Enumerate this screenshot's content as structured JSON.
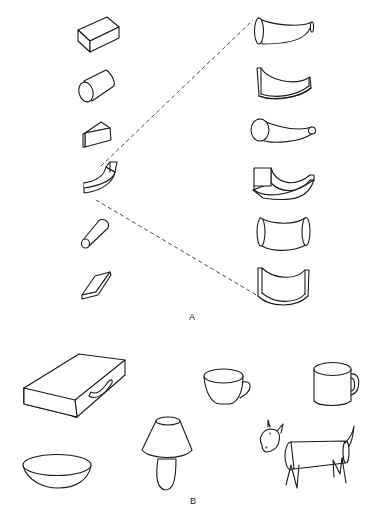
{
  "figure": {
    "colors": {
      "stroke": "#1a1a1a",
      "background": "#ffffff"
    },
    "panel_a": {
      "label": "A",
      "left_column_primitives": [
        {
          "id": "rectangular-block",
          "description": "rectangular prism"
        },
        {
          "id": "cylinder",
          "description": "cylinder"
        },
        {
          "id": "wedge",
          "description": "triangular wedge"
        },
        {
          "id": "curved-block",
          "description": "curved bent block"
        },
        {
          "id": "cone",
          "description": "truncated cone"
        },
        {
          "id": "flat-slab",
          "description": "flat parallelogram slab"
        }
      ],
      "right_column_variants": [
        {
          "id": "curved-horn-elliptic-end",
          "description": "curved tapering horn with elliptical ends"
        },
        {
          "id": "curved-flat-channel",
          "description": "curved channel with flat rectangular ends"
        },
        {
          "id": "curved-horn-round",
          "description": "curved tapering horn with round ends"
        },
        {
          "id": "curved-horn-square-end",
          "description": "curved tapering shape with square end"
        },
        {
          "id": "curved-tube-symmetric",
          "description": "symmetric curved tube with elliptical ends"
        },
        {
          "id": "curved-channel-symmetric",
          "description": "symmetric curved channel with flat ends"
        }
      ],
      "connectors": [
        "dashed-line-upper",
        "dashed-line-lower"
      ]
    },
    "panel_b": {
      "label": "B",
      "objects": [
        {
          "id": "briefcase",
          "description": "briefcase"
        },
        {
          "id": "teacup",
          "description": "teacup"
        },
        {
          "id": "mug",
          "description": "mug"
        },
        {
          "id": "bowl",
          "description": "bowl"
        },
        {
          "id": "lamp",
          "description": "table lamp"
        },
        {
          "id": "goat",
          "description": "goat made of geometric primitives"
        }
      ]
    }
  }
}
